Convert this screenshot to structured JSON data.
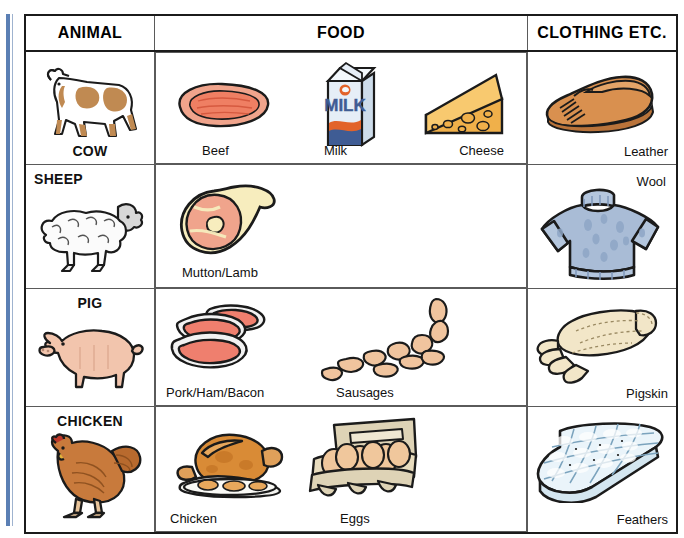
{
  "document": {
    "title": "Animal Products Table",
    "kind": "educational-reference-table"
  },
  "palette": {
    "binding_blue": "#5b7fb4",
    "cow_brown": "#c08a52",
    "beef_pink": "#ef8e78",
    "milk_blue": "#3f5c94",
    "milk_orange": "#e2632a",
    "cheese_orange": "#f4b74e",
    "leather_tan": "#d08b4d",
    "wool_blue": "#a9bcd6",
    "pig_pink": "#f2c5ad",
    "glove_cream": "#f2e6c8",
    "chicken_brown": "#c87a3c",
    "egg_cream": "#e8d9bc",
    "feather_white": "#eaf4fa",
    "sheep_white": "#fbfbfb",
    "border_dark": "#1b1b1b",
    "border_light": "#5a5a5a"
  },
  "table": {
    "columns": [
      {
        "id": "animal",
        "label": "ANIMAL"
      },
      {
        "id": "food",
        "label": "FOOD"
      },
      {
        "id": "clothing",
        "label": "CLOTHING ETC."
      }
    ],
    "rows": [
      {
        "id": "cow",
        "animal": {
          "name": "COW",
          "icon": "cow-illustration",
          "name_position": "bottom-center"
        },
        "food": [
          {
            "label": "Beef",
            "icon": "beef-steak-illustration"
          },
          {
            "label": "Milk",
            "icon": "milk-carton-illustration"
          },
          {
            "label": "Cheese",
            "icon": "cheese-wedge-illustration"
          }
        ],
        "clothing": [
          {
            "label": "Leather",
            "icon": "leather-shoe-illustration",
            "label_position": "bottom-right"
          }
        ]
      },
      {
        "id": "sheep",
        "animal": {
          "name": "SHEEP",
          "icon": "sheep-illustration",
          "name_position": "top-left"
        },
        "food": [
          {
            "label": "Mutton/Lamb",
            "icon": "lamb-leg-illustration"
          }
        ],
        "clothing": [
          {
            "label": "Wool",
            "icon": "wool-sweater-illustration",
            "label_position": "top-right"
          }
        ]
      },
      {
        "id": "pig",
        "animal": {
          "name": "PIG",
          "icon": "pig-illustration",
          "name_position": "top-center"
        },
        "food": [
          {
            "label": "Pork/Ham/Bacon",
            "icon": "pork-chops-illustration"
          },
          {
            "label": "Sausages",
            "icon": "sausages-illustration"
          }
        ],
        "clothing": [
          {
            "label": "Pigskin",
            "icon": "pigskin-gloves-illustration",
            "label_position": "bottom-right"
          }
        ]
      },
      {
        "id": "chicken",
        "animal": {
          "name": "CHICKEN",
          "icon": "chicken-hen-illustration",
          "name_position": "top-center"
        },
        "food": [
          {
            "label": "Chicken",
            "icon": "roast-chicken-illustration"
          },
          {
            "label": "Eggs",
            "icon": "egg-carton-illustration"
          }
        ],
        "clothing": [
          {
            "label": "Feathers",
            "icon": "feather-duvet-illustration",
            "label_position": "bottom-right"
          }
        ]
      }
    ]
  }
}
